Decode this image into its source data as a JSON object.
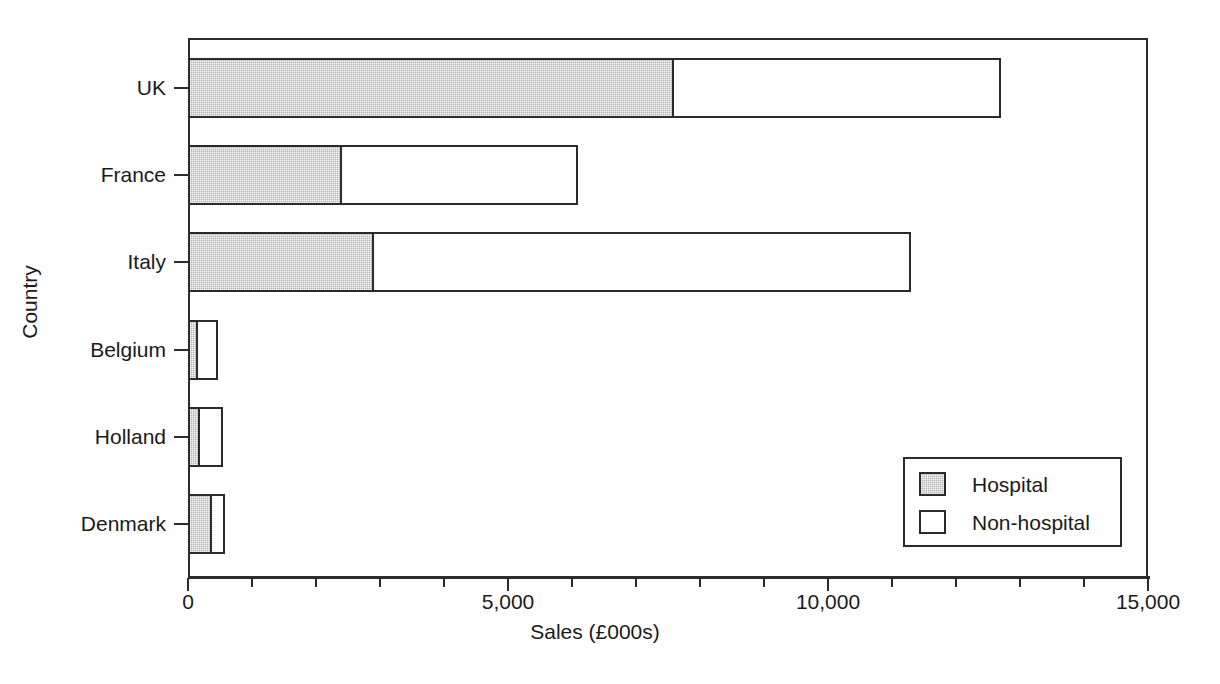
{
  "chart_data": {
    "type": "bar",
    "orientation": "horizontal",
    "stacked": true,
    "title": "",
    "xlabel": "Sales (£000s)",
    "ylabel": "Country",
    "categories": [
      "UK",
      "France",
      "Italy",
      "Belgium",
      "Holland",
      "Denmark"
    ],
    "series": [
      {
        "name": "Hospital",
        "values": [
          7600,
          2400,
          2900,
          160,
          190,
          380
        ]
      },
      {
        "name": "Non-hospital",
        "values": [
          5100,
          3700,
          8400,
          310,
          360,
          200
        ]
      }
    ],
    "totals": [
      12700,
      6100,
      11300,
      470,
      550,
      580
    ],
    "xlim": [
      0,
      15000
    ],
    "xticks": [
      0,
      5000,
      10000,
      15000
    ],
    "xtick_labels": [
      "0",
      "5,000",
      "10,000",
      "15,000"
    ],
    "xtick_minor_step": 1000,
    "grid": false,
    "legend_position": "bottom-right",
    "legend_entries": [
      "Hospital",
      "Non-hospital"
    ],
    "colors": {
      "hospital": "#b3b3b3",
      "non_hospital": "#ffffff",
      "outline": "#2b2b2b",
      "text": "#1a1a1a"
    }
  }
}
